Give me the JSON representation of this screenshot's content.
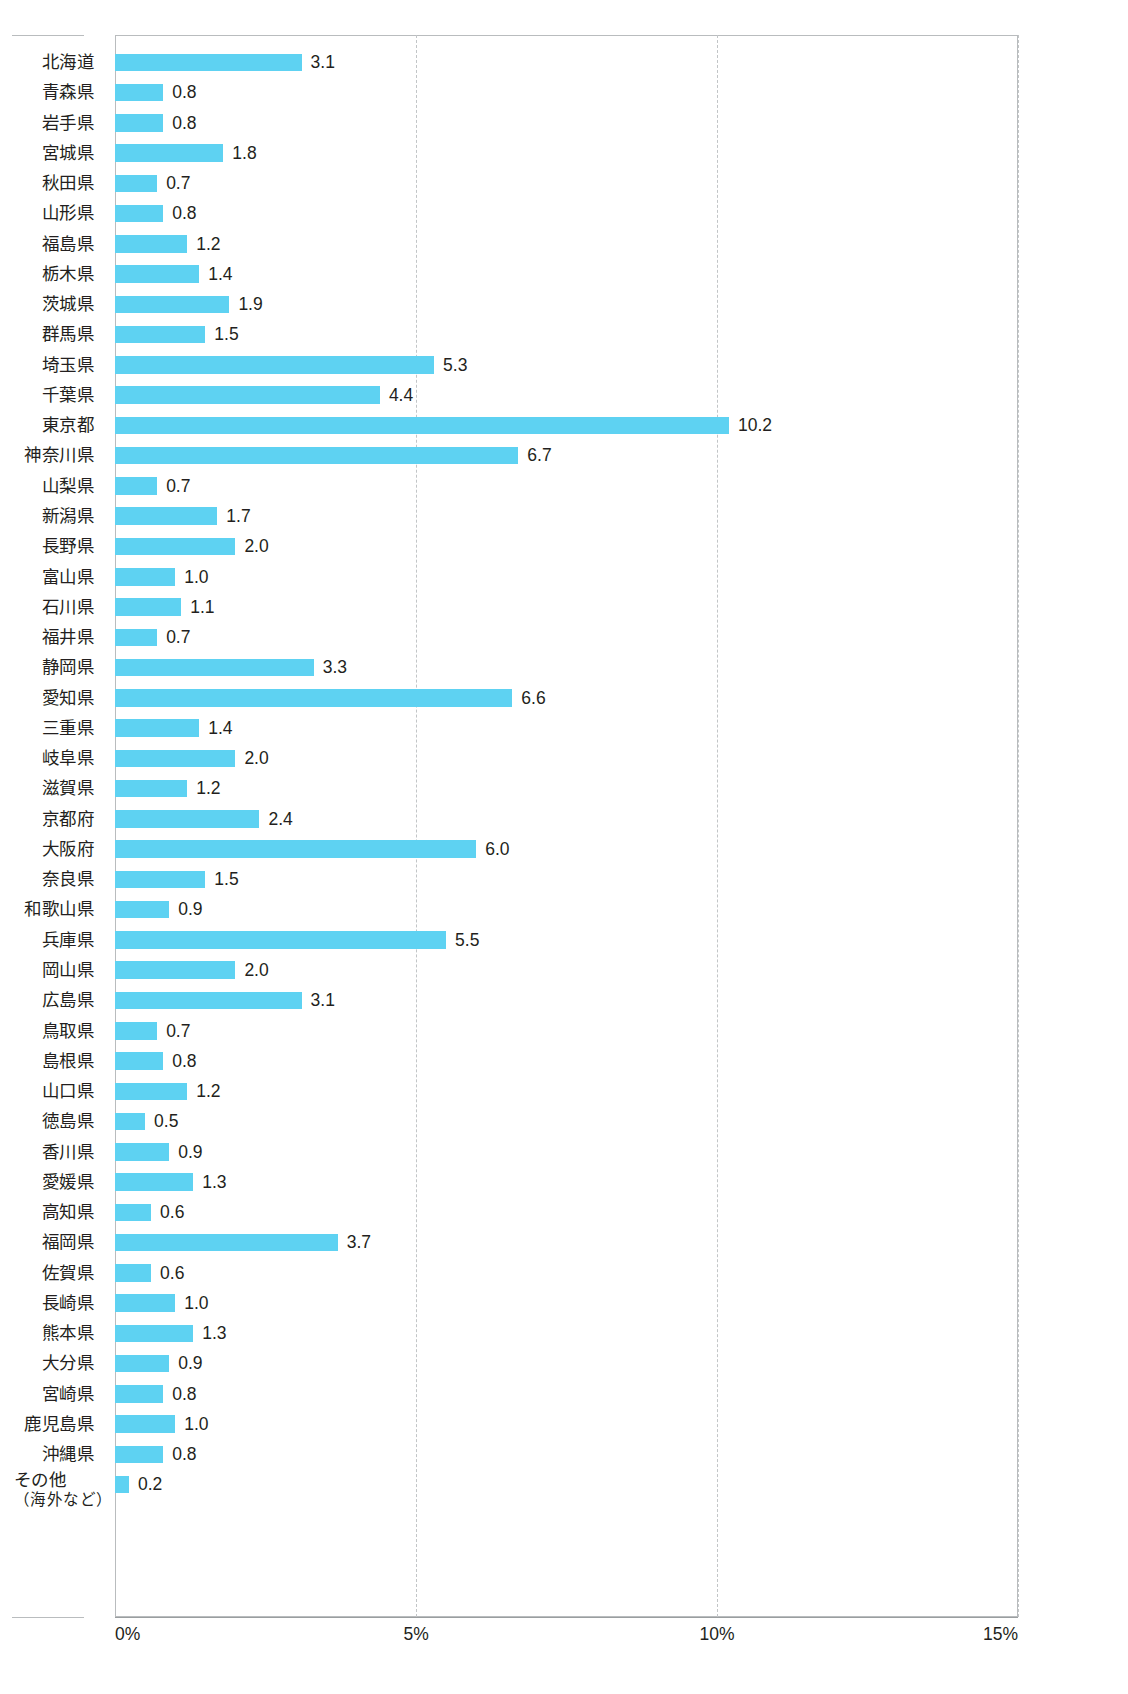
{
  "chart_data": {
    "type": "bar",
    "orientation": "horizontal",
    "title": "",
    "subtitle": "",
    "xlabel": "",
    "ylabel": "",
    "xlim": [
      0,
      15
    ],
    "unit": "%",
    "grid": true,
    "gridlines": [
      0,
      5,
      10,
      15
    ],
    "legend": "none",
    "value_label_format": "one-decimal",
    "bar_color": "#5ed2f2",
    "axis_color": "#b9bcbe",
    "text_color": "#231f20",
    "axis_ticks": [
      "0%",
      "5%",
      "10%",
      "15%"
    ],
    "axis_tick_values": [
      0,
      5,
      10,
      15
    ],
    "categories": [
      "北海道",
      "青森県",
      "岩手県",
      "宮城県",
      "秋田県",
      "山形県",
      "福島県",
      "栃木県",
      "茨城県",
      "群馬県",
      "埼玉県",
      "千葉県",
      "東京都",
      "神奈川県",
      "山梨県",
      "新潟県",
      "長野県",
      "富山県",
      "石川県",
      "福井県",
      "静岡県",
      "愛知県",
      "三重県",
      "岐阜県",
      "滋賀県",
      "京都府",
      "大阪府",
      "奈良県",
      "和歌山県",
      "兵庫県",
      "岡山県",
      "広島県",
      "鳥取県",
      "島根県",
      "山口県",
      "徳島県",
      "香川県",
      "愛媛県",
      "高知県",
      "福岡県",
      "佐賀県",
      "長崎県",
      "熊本県",
      "大分県",
      "宮崎県",
      "鹿児島県",
      "沖縄県",
      "その他"
    ],
    "values": [
      3.1,
      0.8,
      0.8,
      1.8,
      0.7,
      0.8,
      1.2,
      1.4,
      1.9,
      1.5,
      5.3,
      4.4,
      10.2,
      6.7,
      0.7,
      1.7,
      2.0,
      1.0,
      1.1,
      0.7,
      3.3,
      6.6,
      1.4,
      2.0,
      1.2,
      2.4,
      6.0,
      1.5,
      0.9,
      5.5,
      2.0,
      3.1,
      0.7,
      0.8,
      1.2,
      0.5,
      0.9,
      1.3,
      0.6,
      3.7,
      0.6,
      1.0,
      1.3,
      0.9,
      0.8,
      1.0,
      0.8,
      0.2
    ],
    "value_labels": [
      "3.1",
      "0.8",
      "0.8",
      "1.8",
      "0.7",
      "0.8",
      "1.2",
      "1.4",
      "1.9",
      "1.5",
      "5.3",
      "4.4",
      "10.2",
      "6.7",
      "0.7",
      "1.7",
      "2.0",
      "1.0",
      "1.1",
      "0.7",
      "3.3",
      "6.6",
      "1.4",
      "2.0",
      "1.2",
      "2.4",
      "6.0",
      "1.5",
      "0.9",
      "5.5",
      "2.0",
      "3.1",
      "0.7",
      "0.8",
      "1.2",
      "0.5",
      "0.9",
      "1.3",
      "0.6",
      "3.7",
      "0.6",
      "1.0",
      "1.3",
      "0.9",
      "0.8",
      "1.0",
      "0.8",
      "0.2"
    ],
    "last_category_second_line": "（海外など）"
  }
}
